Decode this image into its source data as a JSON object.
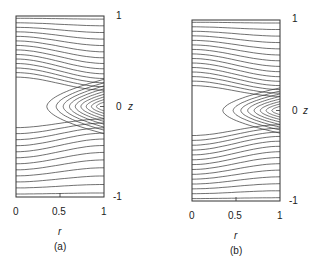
{
  "panels": [
    {
      "id": "a",
      "caption": "(a)",
      "box": {
        "left": 16,
        "right": 104,
        "top": 16,
        "bottom": 197
      },
      "x_ticks": [
        "0",
        "0.5",
        "1"
      ],
      "x_label": "r",
      "y_ticks": {
        "top": "1",
        "mid": "0",
        "bottom": "-1"
      },
      "y_label": "z",
      "upper_lines": 14,
      "lower_lines": 12,
      "loops": 9,
      "sep_up": 0.3,
      "sep_down": -0.2
    },
    {
      "id": "b",
      "caption": "(b)",
      "box": {
        "left": 192,
        "right": 280,
        "top": 20,
        "bottom": 201
      },
      "x_ticks": [
        "0",
        "0.5",
        "1"
      ],
      "x_label": "r",
      "y_ticks": {
        "top": "1",
        "mid": "0",
        "bottom": "-1"
      },
      "y_label": "z",
      "upper_lines": 15,
      "lower_lines": 14,
      "loops": 8,
      "sep_up": 0.25,
      "sep_down": -0.25
    }
  ],
  "line_color": "#333333"
}
